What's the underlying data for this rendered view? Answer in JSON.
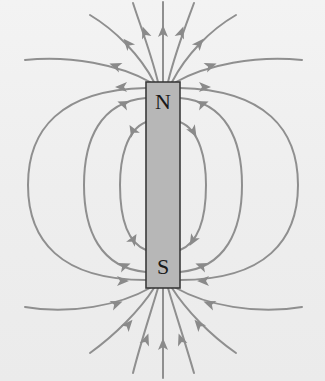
{
  "diagram": {
    "colors": {
      "field_line": "#8f8f8f",
      "magnet_fill": "#b7b7b7",
      "magnet_border": "#3a3a3a",
      "background": "#f0f0f0"
    },
    "magnet": {
      "x": 146,
      "y": 82,
      "width": 34,
      "height": 206
    },
    "poles": [
      {
        "label": "N",
        "position": "top"
      },
      {
        "label": "S",
        "position": "bottom"
      }
    ],
    "field_lines": [
      {
        "id": "top-vertical",
        "d": "M163,82 L163,2",
        "arrow": [
          163,
          32,
          -90
        ]
      },
      {
        "id": "top-l1",
        "d": "M158,82 C150,50 140,25 133,3",
        "arrow": [
          145,
          33,
          -110
        ]
      },
      {
        "id": "top-r1",
        "d": "M168,82 C176,50 186,25 194,3",
        "arrow": [
          181,
          33,
          -70
        ]
      },
      {
        "id": "top-l2",
        "d": "M154,82 C140,55 115,30 90,15",
        "arrow": [
          128,
          44,
          -130
        ]
      },
      {
        "id": "top-r2",
        "d": "M172,82 C186,55 210,30 236,15",
        "arrow": [
          199,
          44,
          -50
        ]
      },
      {
        "id": "top-l3",
        "d": "M150,82 C120,65 70,55 25,60",
        "arrow": [
          116,
          66,
          -160
        ]
      },
      {
        "id": "top-r3",
        "d": "M176,82 C206,65 256,55 302,60",
        "arrow": [
          210,
          66,
          -20
        ]
      },
      {
        "id": "bot-vertical",
        "d": "M163,378 L163,288",
        "arrow": [
          163,
          345,
          -90
        ]
      },
      {
        "id": "bot-l1",
        "d": "M133,373 C140,345 150,315 158,288",
        "arrow": [
          146,
          340,
          -70
        ]
      },
      {
        "id": "bot-r1",
        "d": "M194,373 C186,345 176,315 168,288",
        "arrow": [
          181,
          340,
          -110
        ]
      },
      {
        "id": "bot-l2",
        "d": "M90,353 C115,335 140,310 154,288",
        "arrow": [
          128,
          325,
          -50
        ]
      },
      {
        "id": "bot-r2",
        "d": "M236,353 C210,335 186,310 172,288",
        "arrow": [
          199,
          325,
          -130
        ]
      },
      {
        "id": "bot-l3",
        "d": "M25,307 C70,315 120,305 150,288",
        "arrow": [
          116,
          304,
          -20
        ]
      },
      {
        "id": "bot-r3",
        "d": "M302,307 C256,315 206,305 176,288",
        "arrow": [
          210,
          304,
          -160
        ]
      },
      {
        "id": "loop-left-outer",
        "d": "M146,88 C60,90 28,130 28,185 C28,240 60,280 146,280",
        "arrow": [
          122,
          87,
          180
        ],
        "arrow2": [
          122,
          281,
          0
        ]
      },
      {
        "id": "loop-left-mid",
        "d": "M146,98 C100,102 84,140 84,185 C84,230 100,268 146,272",
        "arrow": [
          124,
          104,
          -160
        ],
        "arrow2": [
          124,
          266,
          -20
        ]
      },
      {
        "id": "loop-left-inner",
        "d": "M146,122 C126,130 120,160 120,185 C120,215 126,242 146,250",
        "arrow": [
          133,
          131,
          -120
        ],
        "arrow2": [
          133,
          240,
          -60
        ]
      },
      {
        "id": "loop-right-outer",
        "d": "M180,88 C266,90 298,130 298,185 C298,240 266,280 180,280",
        "arrow": [
          204,
          87,
          0
        ],
        "arrow2": [
          204,
          281,
          180
        ]
      },
      {
        "id": "loop-right-mid",
        "d": "M180,98 C226,102 242,140 242,185 C242,230 226,268 180,272",
        "arrow": [
          202,
          104,
          -20
        ],
        "arrow2": [
          202,
          266,
          -160
        ]
      },
      {
        "id": "loop-right-inner",
        "d": "M180,122 C200,130 206,160 206,185 C206,215 200,242 180,250",
        "arrow": [
          193,
          131,
          60
        ],
        "arrow2": [
          193,
          240,
          120
        ]
      }
    ]
  }
}
